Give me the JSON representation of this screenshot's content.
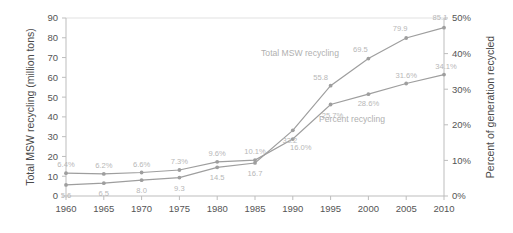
{
  "chart_data": {
    "type": "line",
    "title": "",
    "xlabel": "",
    "ylabel": "Total MSW recycling (million tons)",
    "y2label": "Percent of generation recycled",
    "categories": [
      "1960",
      "1965",
      "1970",
      "1975",
      "1980",
      "1985",
      "1990",
      "1995",
      "2000",
      "2005",
      "2010"
    ],
    "ylim": [
      0,
      90
    ],
    "y2lim": [
      0,
      50
    ],
    "yticks": [
      "0",
      "10",
      "20",
      "30",
      "40",
      "50",
      "60",
      "70",
      "80",
      "90"
    ],
    "y2ticks": [
      "0%",
      "10%",
      "20%",
      "30%",
      "40%",
      "50%"
    ],
    "grid": false,
    "legend_position": "inline-annotation",
    "series": [
      {
        "name": "Total MSW recycling",
        "axis": "left",
        "units": "million tons",
        "color": "#9e9e9e",
        "values": [
          5.6,
          6.5,
          8.0,
          9.3,
          14.5,
          16.7,
          33.2,
          55.8,
          69.5,
          79.9,
          85.1
        ],
        "labels": [
          "5.6",
          "6.5",
          "8.0",
          "9.3",
          "14.5",
          "16.7",
          "33.2",
          "55.8",
          "69.5",
          "79.9",
          "85.1"
        ]
      },
      {
        "name": "Percent recycling",
        "axis": "right",
        "units": "percent",
        "color": "#9e9e9e",
        "values": [
          6.4,
          6.2,
          6.6,
          7.3,
          9.6,
          10.1,
          16.0,
          25.7,
          28.6,
          31.6,
          34.1
        ],
        "labels": [
          "6.4%",
          "6.2%",
          "6.6%",
          "7.3%",
          "9.6%",
          "10.1%",
          "16.0%",
          "25.7%",
          "28.6%",
          "31.6%",
          "34.1%"
        ]
      }
    ],
    "annotations": [
      {
        "text": "Total MSW recycling",
        "series": 0
      },
      {
        "text": "Percent recycling",
        "series": 1
      }
    ]
  }
}
